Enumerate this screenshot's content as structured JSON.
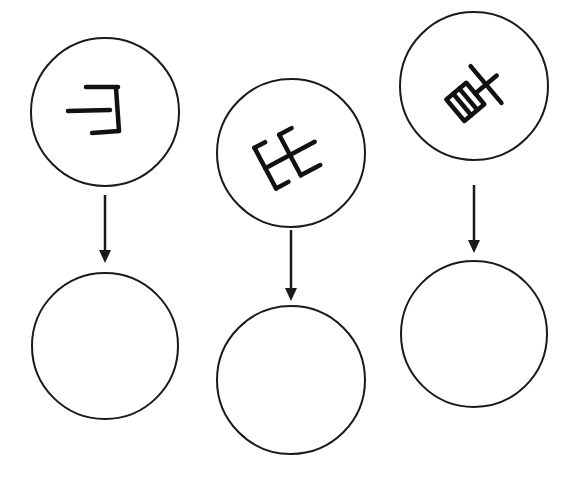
{
  "diagram": {
    "type": "rotated-glyph-to-blank-mapping",
    "columns": [
      {
        "id": "col-1",
        "source": {
          "cx": 105,
          "cy": 112,
          "r": 74,
          "glyph": "rotated-glyph-1",
          "rotation_hint": "rotated ~180deg, mirrored E-like stroke shape"
        },
        "arrow": {
          "x": 105,
          "y1": 195,
          "y2": 262
        },
        "target": {
          "cx": 105,
          "cy": 346,
          "r": 74,
          "content": ""
        }
      },
      {
        "id": "col-2",
        "source": {
          "cx": 291,
          "cy": 153,
          "r": 74,
          "glyph": "rotated-glyph-2",
          "rotation_hint": "rotated ~-30deg, double-E-like stroke shape"
        },
        "arrow": {
          "x": 291,
          "y1": 230,
          "y2": 300
        },
        "target": {
          "cx": 291,
          "cy": 380,
          "r": 74,
          "content": ""
        }
      },
      {
        "id": "col-3",
        "source": {
          "cx": 474,
          "cy": 86,
          "r": 74,
          "glyph": "rotated-glyph-3",
          "rotation_hint": "rotated ~-45deg, box-with-cross stroke shape"
        },
        "arrow": {
          "x": 474,
          "y1": 185,
          "y2": 253
        },
        "target": {
          "cx": 474,
          "cy": 334,
          "r": 74,
          "content": ""
        }
      }
    ],
    "colors": {
      "stroke": "#1a1a1a",
      "background": "#ffffff"
    }
  }
}
